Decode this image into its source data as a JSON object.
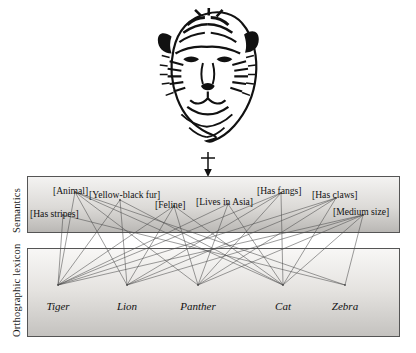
{
  "figure": {
    "background_color": "#ffffff",
    "image": {
      "name": "tiger-head-illustration",
      "description": "Black and white line-art illustration of a tiger's head",
      "x": 150,
      "y": 8,
      "width": 116,
      "height": 140
    },
    "connector": {
      "name": "input-arrow",
      "description": "Vertical arrow with crossbar pointing down from the tiger image into the Semantics layer",
      "x": 208,
      "y_top": 152,
      "y_bottom": 176
    }
  },
  "layers": [
    {
      "id": "semantics",
      "caption": "Semantics",
      "box": {
        "x": 27,
        "y": 176,
        "width": 373,
        "height": 57
      },
      "gradient_from": "#f4f3f2",
      "gradient_to": "#b9b7b4",
      "border_color": "#555555"
    },
    {
      "id": "orthographic_lexicon",
      "caption": "Orthographic lexicon",
      "box": {
        "x": 27,
        "y": 248,
        "width": 373,
        "height": 89
      },
      "gradient_from": "#f7f6f5",
      "gradient_to": "#c6c4c1",
      "border_color": "#555555"
    }
  ],
  "semantics": {
    "caption": "Semantics",
    "features": [
      {
        "id": "has_stripes",
        "label": "[Has stripes]",
        "label_x": 30,
        "label_y": 209,
        "node_x": 63,
        "node_y": 215
      },
      {
        "id": "animal",
        "label": "[Animal]",
        "label_x": 53,
        "label_y": 186,
        "node_x": 75,
        "node_y": 192
      },
      {
        "id": "yellow_black_fur",
        "label": "[Yellow-black fur]",
        "label_x": 89,
        "label_y": 190,
        "node_x": 120,
        "node_y": 200
      },
      {
        "id": "feline",
        "label": "[Feline]",
        "label_x": 155,
        "label_y": 200,
        "node_x": 174,
        "node_y": 206
      },
      {
        "id": "lives_in_asia",
        "label": "[Lives in Asia]",
        "label_x": 196,
        "label_y": 197,
        "node_x": 228,
        "node_y": 204
      },
      {
        "id": "has_fangs",
        "label": "[Has fangs]",
        "label_x": 257,
        "label_y": 186,
        "node_x": 281,
        "node_y": 193
      },
      {
        "id": "has_claws",
        "label": "[Has claws]",
        "label_x": 312,
        "label_y": 190,
        "node_x": 336,
        "node_y": 198
      },
      {
        "id": "medium_size",
        "label": "[Medium size]",
        "label_x": 333,
        "label_y": 207,
        "node_x": 363,
        "node_y": 215
      }
    ]
  },
  "orthographic_lexicon": {
    "caption": "Orthographic lexicon",
    "words": [
      {
        "id": "tiger",
        "label": "Tiger",
        "label_x": 58,
        "label_y": 301,
        "node_x": 58,
        "node_y": 285
      },
      {
        "id": "lion",
        "label": "Lion",
        "label_x": 127,
        "label_y": 301,
        "node_x": 127,
        "node_y": 285
      },
      {
        "id": "panther",
        "label": "Panther",
        "label_x": 198,
        "label_y": 301,
        "node_x": 198,
        "node_y": 285
      },
      {
        "id": "cat",
        "label": "Cat",
        "label_x": 283,
        "label_y": 301,
        "node_x": 283,
        "node_y": 285
      },
      {
        "id": "zebra",
        "label": "Zebra",
        "label_x": 345,
        "label_y": 301,
        "node_x": 345,
        "node_y": 285
      }
    ]
  },
  "connections": {
    "line_color": "#4c4c4c",
    "line_width": 0.55,
    "edges": [
      [
        "has_stripes",
        "tiger"
      ],
      [
        "has_stripes",
        "zebra"
      ],
      [
        "animal",
        "tiger"
      ],
      [
        "animal",
        "lion"
      ],
      [
        "animal",
        "panther"
      ],
      [
        "animal",
        "cat"
      ],
      [
        "animal",
        "zebra"
      ],
      [
        "yellow_black_fur",
        "tiger"
      ],
      [
        "yellow_black_fur",
        "lion"
      ],
      [
        "yellow_black_fur",
        "cat"
      ],
      [
        "feline",
        "tiger"
      ],
      [
        "feline",
        "lion"
      ],
      [
        "feline",
        "panther"
      ],
      [
        "feline",
        "cat"
      ],
      [
        "lives_in_asia",
        "tiger"
      ],
      [
        "lives_in_asia",
        "panther"
      ],
      [
        "lives_in_asia",
        "cat"
      ],
      [
        "has_fangs",
        "tiger"
      ],
      [
        "has_fangs",
        "lion"
      ],
      [
        "has_fangs",
        "panther"
      ],
      [
        "has_fangs",
        "cat"
      ],
      [
        "has_claws",
        "tiger"
      ],
      [
        "has_claws",
        "lion"
      ],
      [
        "has_claws",
        "panther"
      ],
      [
        "has_claws",
        "cat"
      ],
      [
        "medium_size",
        "tiger"
      ],
      [
        "medium_size",
        "lion"
      ],
      [
        "medium_size",
        "panther"
      ],
      [
        "medium_size",
        "cat"
      ],
      [
        "medium_size",
        "zebra"
      ]
    ]
  }
}
